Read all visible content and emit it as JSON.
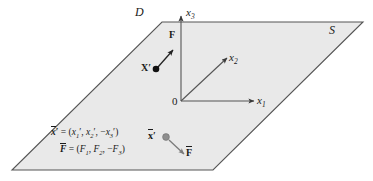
{
  "figure": {
    "type": "geometry-diagram",
    "background": "#ffffff",
    "plane": {
      "name_label": "S",
      "domain_label": "D",
      "fill_color": "#e8e8e8",
      "stroke_color": "#4d4d4d",
      "corners": [
        {
          "x": 162,
          "y": 22
        },
        {
          "x": 363,
          "y": 22
        },
        {
          "x": 213,
          "y": 170
        },
        {
          "x": 12,
          "y": 170
        }
      ]
    },
    "axes": [
      {
        "name": "x3-axis",
        "label": "x",
        "sub": "3",
        "from": {
          "x": 181,
          "y": 101
        },
        "to": {
          "x": 181,
          "y": 14
        }
      },
      {
        "name": "x2-axis",
        "label": "x",
        "sub": "2",
        "from": {
          "x": 181,
          "y": 101
        },
        "to": {
          "x": 229,
          "y": 56
        }
      },
      {
        "name": "x1-axis",
        "label": "x",
        "sub": "1",
        "from": {
          "x": 181,
          "y": 101
        },
        "to": {
          "x": 256,
          "y": 101
        }
      }
    ],
    "origin": {
      "label": "0",
      "x": 181,
      "y": 101
    },
    "points": [
      {
        "name": "point-x-prime",
        "label": "X",
        "prime": "′",
        "overbar": false,
        "color": "#111111",
        "x": 156,
        "y": 69,
        "radius": 3.2
      },
      {
        "name": "point-x-bar-prime",
        "label": "x",
        "prime": "′",
        "overbar": true,
        "color": "#8c8c8c",
        "x": 166,
        "y": 137,
        "radius": 3.2
      }
    ],
    "vectors": [
      {
        "name": "force-vector-F",
        "label": "F",
        "overbar": false,
        "color": "#222222",
        "from": {
          "x": 158,
          "y": 67
        },
        "to": {
          "x": 174,
          "y": 48
        },
        "label_pos": {
          "x": 171,
          "y": 34
        }
      },
      {
        "name": "force-vector-F-bar",
        "label": "F",
        "overbar": true,
        "color": "#7a7a7a",
        "from": {
          "x": 169,
          "y": 139
        },
        "to": {
          "x": 185,
          "y": 155
        },
        "label_pos": {
          "x": 187,
          "y": 150
        }
      }
    ],
    "equations": [
      {
        "name": "position-equation",
        "lhs": "x",
        "lhs_prime": "′",
        "lhs_overbar": true,
        "text": "= (x′1, x′2, −x′3)",
        "components": [
          "x′1",
          "x′2",
          "−x′3"
        ],
        "x": 52,
        "y": 128
      },
      {
        "name": "force-equation",
        "lhs": "F",
        "lhs_prime": "",
        "lhs_overbar": true,
        "text": "= (F1, F2, −F3)",
        "components": [
          "F1",
          "F2",
          "−F3"
        ],
        "x": 60,
        "y": 145
      }
    ],
    "region_labels": [
      {
        "name": "domain-label-D",
        "text": "D",
        "x": 137,
        "y": 8
      },
      {
        "name": "surface-label-S",
        "text": "S",
        "x": 330,
        "y": 25
      }
    ]
  }
}
